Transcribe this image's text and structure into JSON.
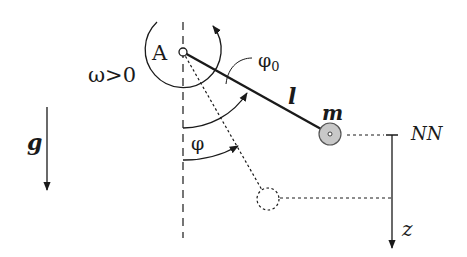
{
  "diagram": {
    "type": "pendulum-schematic",
    "labels": {
      "pivot": "A",
      "omega": "ω>0",
      "phi0": "φ",
      "phi0_sub": "0",
      "phi": "φ",
      "length": "l",
      "mass": "m",
      "gravity": "g",
      "reference_level": "NN",
      "z_axis": "z"
    },
    "colors": {
      "stroke": "#1a1a1a",
      "mass_fill": "#c8c8c8",
      "background": "#ffffff"
    },
    "elements": {
      "pivot": {
        "x": 183,
        "y": 52
      },
      "mass_position": {
        "x": 330,
        "y": 134,
        "r": 11
      },
      "ghost_mass_position": {
        "x": 268,
        "y": 199,
        "r": 11
      },
      "z_axis": {
        "x": 392,
        "y_start": 135,
        "y_end": 248
      },
      "gravity_arrow": {
        "x": 47,
        "y_start": 107,
        "y_end": 190
      }
    }
  }
}
